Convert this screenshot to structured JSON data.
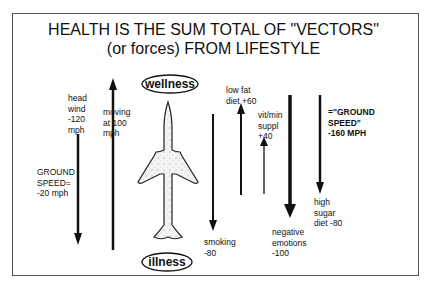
{
  "title": {
    "line1": "HEALTH IS THE SUM TOTAL OF \"VECTORS\"",
    "line2": "(or forces) FROM LIFESTYLE"
  },
  "plane": {
    "top_label": "wellness",
    "bottom_label": "illness"
  },
  "vectors": [
    {
      "id": "head-wind",
      "label": "head\nwind\n-120\nmph",
      "value": -120,
      "direction": "down"
    },
    {
      "id": "moving",
      "label": "moving\nat 100\nmph",
      "value": 100,
      "direction": "up"
    },
    {
      "id": "ground-speed-left",
      "label": "GROUND\nSPEED=\n-20 mph",
      "value": -20
    },
    {
      "id": "smoking",
      "label": "smoking\n-80",
      "value": -80,
      "direction": "down"
    },
    {
      "id": "low-fat-diet",
      "label": "low fat\ndiet +60",
      "value": 60,
      "direction": "up"
    },
    {
      "id": "vit-min-suppl",
      "label": "vit/min\nsuppl\n+40",
      "value": 40,
      "direction": "up"
    },
    {
      "id": "negative-emotions",
      "label": "negative\nemotions\n-100",
      "value": -100,
      "direction": "down"
    },
    {
      "id": "high-sugar-diet",
      "label": "high\nsugar\ndiet -80",
      "value": -80,
      "direction": "down"
    },
    {
      "id": "ground-speed-right",
      "label": "=\"GROUND\nSPEED\"\n-160 MPH",
      "value": -160
    }
  ]
}
